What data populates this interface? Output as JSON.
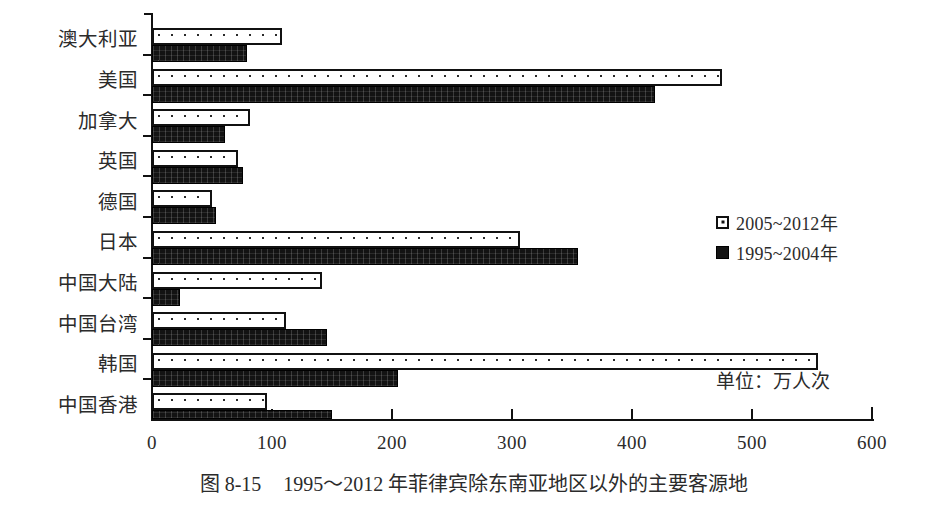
{
  "caption": {
    "figure_number": "图 8-15",
    "text": "1995～2012 年菲律宾除东南亚地区以外的主要客源地"
  },
  "unit_note": "单位：万人次",
  "legend": {
    "position": "right-middle",
    "entries": [
      {
        "label": "2005~2012年",
        "swatch": "dotted-open-square",
        "color": "#ffffff"
      },
      {
        "label": "1995~2004年",
        "swatch": "filled-black-square",
        "color": "#131313"
      }
    ]
  },
  "axis": {
    "x_ticks": [
      "0",
      "100",
      "200",
      "300",
      "400",
      "500",
      "600"
    ],
    "x_min": 0,
    "x_max": 600
  },
  "chart_data": {
    "type": "bar",
    "orientation": "horizontal",
    "title": "1995～2012 年菲律宾除东南亚地区以外的主要客源地",
    "xlabel": "",
    "ylabel": "",
    "xlim": [
      0,
      600
    ],
    "xticks": [
      0,
      100,
      200,
      300,
      400,
      500,
      600
    ],
    "unit": "万人次",
    "grid": false,
    "legend_position": "right-middle",
    "categories": [
      "澳大利亚",
      "美国",
      "加拿大",
      "英国",
      "德国",
      "日本",
      "中国大陆",
      "中国台湾",
      "韩国",
      "中国香港"
    ],
    "series": [
      {
        "name": "2005~2012年",
        "style": "dotted-open",
        "values": [
          108,
          475,
          82,
          72,
          50,
          307,
          142,
          112,
          555,
          96
        ]
      },
      {
        "name": "1995~2004年",
        "style": "solid-black",
        "values": [
          79,
          419,
          61,
          76,
          53,
          355,
          23,
          146,
          205,
          150
        ]
      }
    ]
  }
}
